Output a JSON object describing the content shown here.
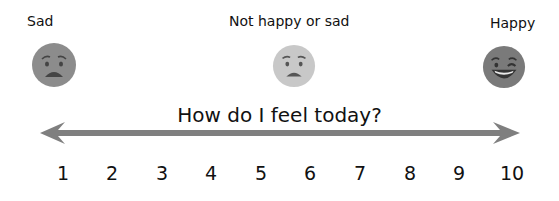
{
  "labels": {
    "sad": "Sad",
    "neutral": "Not happy or sad",
    "happy": "Happy"
  },
  "faces": [
    {
      "name": "sad-face",
      "color": "#8c8c8c"
    },
    {
      "name": "neutral-face",
      "color": "#c8c8c8"
    },
    {
      "name": "happy-face",
      "color": "#7a7a7a"
    }
  ],
  "title": "How do I feel today?",
  "scale": {
    "arrow_color": "#7f7f7f",
    "numbers": [
      "1",
      "2",
      "3",
      "4",
      "5",
      "6",
      "7",
      "8",
      "9",
      "10"
    ]
  }
}
